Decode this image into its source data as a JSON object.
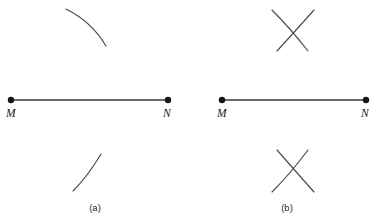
{
  "figure": {
    "type": "geometry-construction",
    "background_color": "#ffffff",
    "line_color": "#3a3a3a",
    "arc_color": "#4a4a4a",
    "dot_color": "#161616",
    "label_color": "#161616",
    "caption_color": "#2a2a2a",
    "width": 387,
    "height": 219
  },
  "top_clipped_text": "",
  "panels": [
    {
      "id": "a",
      "caption": "(a)",
      "caption_x": 95,
      "caption_y": 211,
      "segment": {
        "name": "segment-MN",
        "x1": 11,
        "y1": 100,
        "x2": 168,
        "y2": 100
      },
      "endpoints": [
        {
          "label": "M",
          "cx": 11,
          "cy": 100,
          "r": 3.2,
          "label_x": 6,
          "label_y": 117
        },
        {
          "label": "N",
          "cx": 168,
          "cy": 100,
          "r": 3.2,
          "label_x": 163,
          "label_y": 117
        }
      ],
      "arcs": [
        {
          "name": "upper-arc",
          "d": "M 66,9 Q 92,22 106,46",
          "position": "above"
        },
        {
          "name": "lower-arc",
          "d": "M 73,191 Q 88,176 101,154",
          "position": "below"
        }
      ]
    },
    {
      "id": "b",
      "caption": "(b)",
      "caption_x": 287,
      "caption_y": 211,
      "segment": {
        "name": "segment-MN",
        "x1": 222,
        "y1": 100,
        "x2": 366,
        "y2": 100
      },
      "endpoints": [
        {
          "label": "M",
          "cx": 222,
          "cy": 100,
          "r": 3.2,
          "label_x": 217,
          "label_y": 117
        },
        {
          "label": "N",
          "cx": 366,
          "cy": 100,
          "r": 3.2,
          "label_x": 361,
          "label_y": 117
        }
      ],
      "arcs": [
        {
          "name": "upper-arc-from-M",
          "d": "M 272,10 Q 290,28 308,51",
          "position": "above"
        },
        {
          "name": "upper-arc-from-N",
          "d": "M 314,10 Q 298,28 277,51",
          "position": "above"
        },
        {
          "name": "lower-arc-from-M",
          "d": "M 272,192 Q 290,174 308,150",
          "position": "below"
        },
        {
          "name": "lower-arc-from-N",
          "d": "M 314,192 Q 298,174 277,150",
          "position": "below"
        }
      ],
      "intersections": [
        {
          "name": "upper-crossing",
          "x": 293,
          "y": 35
        },
        {
          "name": "lower-crossing",
          "x": 293,
          "y": 175
        }
      ]
    }
  ]
}
